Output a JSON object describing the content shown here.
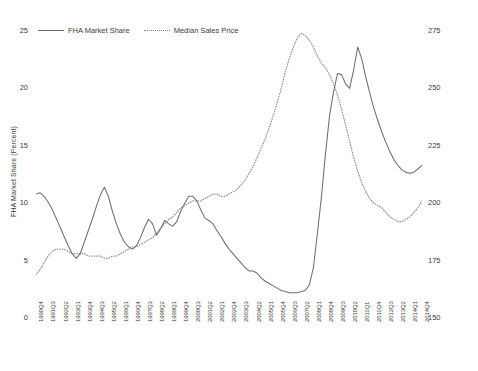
{
  "chart_data": {
    "type": "line",
    "title": "",
    "xlabel": "",
    "grid": false,
    "legend_position": "top-left",
    "axes": {
      "left": {
        "label": "FHA Market Share (Percent)",
        "ticks": [
          "0",
          "5",
          "10",
          "15",
          "20",
          "25"
        ],
        "ylim": [
          0,
          25
        ]
      },
      "right": {
        "label": "Median Sales Price Existing Single-Family Homes (Thousands, 2014$)",
        "ticks": [
          "150",
          "175",
          "200",
          "225",
          "250",
          "275"
        ],
        "ylim": [
          150,
          275
        ]
      }
    },
    "x_tick_labels": [
      "1990Q4",
      "1991Q3",
      "1992Q2",
      "1993Q1",
      "1993Q4",
      "1994Q3",
      "1995Q2",
      "1996Q1",
      "1996Q4",
      "1997Q3",
      "1998Q2",
      "1999Q1",
      "1999Q4",
      "2000Q3",
      "2001Q2",
      "2002Q1",
      "2002Q4",
      "2003Q3",
      "2004Q2",
      "2005Q1",
      "2005Q4",
      "2006Q3",
      "2007Q2",
      "2008Q1",
      "2008Q4",
      "2009Q3",
      "2010Q2",
      "2011Q1",
      "2011Q4",
      "2012Q3",
      "2013Q2",
      "2014Q1",
      "2014Q4"
    ],
    "x_all_quarters": [
      "1990Q4",
      "1991Q1",
      "1991Q2",
      "1991Q3",
      "1991Q4",
      "1992Q1",
      "1992Q2",
      "1992Q3",
      "1992Q4",
      "1993Q1",
      "1993Q2",
      "1993Q3",
      "1993Q4",
      "1994Q1",
      "1994Q2",
      "1994Q3",
      "1994Q4",
      "1995Q1",
      "1995Q2",
      "1995Q3",
      "1995Q4",
      "1996Q1",
      "1996Q2",
      "1996Q3",
      "1996Q4",
      "1997Q1",
      "1997Q2",
      "1997Q3",
      "1997Q4",
      "1998Q1",
      "1998Q2",
      "1998Q3",
      "1998Q4",
      "1999Q1",
      "1999Q2",
      "1999Q3",
      "1999Q4",
      "2000Q1",
      "2000Q2",
      "2000Q3",
      "2000Q4",
      "2001Q1",
      "2001Q2",
      "2001Q3",
      "2001Q4",
      "2002Q1",
      "2002Q2",
      "2002Q3",
      "2002Q4",
      "2003Q1",
      "2003Q2",
      "2003Q3",
      "2003Q4",
      "2004Q1",
      "2004Q2",
      "2004Q3",
      "2004Q4",
      "2005Q1",
      "2005Q2",
      "2005Q3",
      "2005Q4",
      "2006Q1",
      "2006Q2",
      "2006Q3",
      "2006Q4",
      "2007Q1",
      "2007Q2",
      "2007Q3",
      "2007Q4",
      "2008Q1",
      "2008Q2",
      "2008Q3",
      "2008Q4",
      "2009Q1",
      "2009Q2",
      "2009Q3",
      "2009Q4",
      "2010Q1",
      "2010Q2",
      "2010Q3",
      "2010Q4",
      "2011Q1",
      "2011Q2",
      "2011Q3",
      "2011Q4",
      "2012Q1",
      "2012Q2",
      "2012Q3",
      "2012Q4",
      "2013Q1",
      "2013Q2",
      "2013Q3",
      "2013Q4",
      "2014Q1",
      "2014Q2",
      "2014Q3",
      "2014Q4"
    ],
    "series": [
      {
        "name": "FHA Market Share",
        "style": "solid",
        "color": "#6e6e6e",
        "axis": "left",
        "unit": "percent",
        "values": [
          10.8,
          10.9,
          10.6,
          10.1,
          9.5,
          8.7,
          7.9,
          7.1,
          6.3,
          5.6,
          5.2,
          5.6,
          6.6,
          7.6,
          8.6,
          9.7,
          10.7,
          11.4,
          10.6,
          9.3,
          8.2,
          7.3,
          6.6,
          6.2,
          6.0,
          6.3,
          7.0,
          7.9,
          8.6,
          8.2,
          7.2,
          7.8,
          8.5,
          8.2,
          8.0,
          8.4,
          9.3,
          10.0,
          10.6,
          10.6,
          10.2,
          9.4,
          8.7,
          8.5,
          8.2,
          7.6,
          7.1,
          6.5,
          6.0,
          5.6,
          5.2,
          4.8,
          4.4,
          4.1,
          4.1,
          3.9,
          3.5,
          3.2,
          3.0,
          2.8,
          2.6,
          2.4,
          2.3,
          2.2,
          2.2,
          2.2,
          2.3,
          2.4,
          2.9,
          4.4,
          7.4,
          10.6,
          14.3,
          17.6,
          19.7,
          21.3,
          21.2,
          20.4,
          20.0,
          21.6,
          23.6,
          22.6,
          21.0,
          19.6,
          18.3,
          17.2,
          16.2,
          15.3,
          14.5,
          13.8,
          13.3,
          12.9,
          12.7,
          12.6,
          12.7,
          13.0,
          13.3
        ]
      },
      {
        "name": "Median Sales Price",
        "style": "dotted",
        "color": "#8e8e8e",
        "axis": "right",
        "unit": "thousands_2014_dollars",
        "values": [
          169,
          171,
          174,
          177,
          179,
          180,
          180,
          180,
          179,
          178,
          178,
          178,
          178,
          177,
          177,
          177,
          177,
          176,
          176,
          177,
          177,
          178,
          179,
          180,
          181,
          181,
          182,
          183,
          184,
          185,
          187,
          189,
          191,
          193,
          194,
          196,
          198,
          199,
          200,
          201,
          201,
          201,
          202,
          203,
          204,
          204,
          203,
          203,
          204,
          205,
          206,
          208,
          210,
          213,
          216,
          220,
          224,
          228,
          233,
          238,
          244,
          250,
          257,
          263,
          268,
          272,
          274,
          273,
          271,
          268,
          264,
          261,
          259,
          256,
          252,
          247,
          241,
          234,
          227,
          220,
          214,
          209,
          205,
          202,
          200,
          199,
          198,
          196,
          194,
          193,
          192,
          192,
          193,
          194,
          196,
          198,
          201
        ]
      }
    ]
  },
  "legend": {
    "items": [
      {
        "label": "FHA Market Share",
        "style": "solid"
      },
      {
        "label": "Median Sales Price",
        "style": "dotted"
      }
    ]
  }
}
